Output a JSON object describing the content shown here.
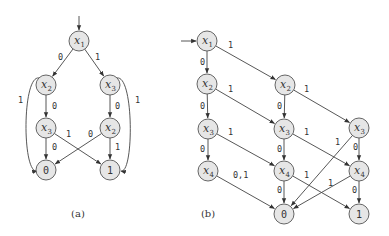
{
  "diagrams": [
    {
      "id": "a",
      "caption": "(a)",
      "caption_pos": [
        78,
        217
      ],
      "entry": {
        "from": [
          79,
          16
        ],
        "to": "n1",
        "dir": "down"
      },
      "nodes": [
        {
          "id": "n1",
          "var": "x",
          "sub": "1",
          "x": 79,
          "y": 41
        },
        {
          "id": "n2",
          "var": "x",
          "sub": "2",
          "x": 46,
          "y": 85
        },
        {
          "id": "n3",
          "var": "x",
          "sub": "3",
          "x": 110,
          "y": 85
        },
        {
          "id": "n4",
          "var": "x",
          "sub": "3",
          "x": 46,
          "y": 128
        },
        {
          "id": "n5",
          "var": "x",
          "sub": "2",
          "x": 110,
          "y": 128
        },
        {
          "id": "t0",
          "terminal": "0",
          "x": 46,
          "y": 170
        },
        {
          "id": "t1",
          "terminal": "1",
          "x": 110,
          "y": 170
        }
      ],
      "edges": [
        {
          "from": "n1",
          "to": "n2",
          "label": "0",
          "lx": 58,
          "ly": 60
        },
        {
          "from": "n1",
          "to": "n3",
          "label": "1",
          "lx": 95,
          "ly": 60
        },
        {
          "from": "n2",
          "to": "n4",
          "label": "0",
          "lx": 52,
          "ly": 109
        },
        {
          "from": "n2",
          "to": "t0",
          "label": "1",
          "lx": 18,
          "ly": 103,
          "curve": "left"
        },
        {
          "from": "n3",
          "to": "n5",
          "label": "0",
          "lx": 115,
          "ly": 109
        },
        {
          "from": "n3",
          "to": "t1",
          "label": "1",
          "lx": 135,
          "ly": 103,
          "curve": "right"
        },
        {
          "from": "n4",
          "to": "t0",
          "label": "0",
          "lx": 52,
          "ly": 150
        },
        {
          "from": "n4",
          "to": "t1",
          "label": "1",
          "lx": 66,
          "ly": 137
        },
        {
          "from": "n5",
          "to": "t0",
          "label": "0",
          "lx": 88,
          "ly": 137
        },
        {
          "from": "n5",
          "to": "t1",
          "label": "1",
          "lx": 115,
          "ly": 150
        }
      ]
    },
    {
      "id": "b",
      "caption": "(b)",
      "caption_pos": [
        208,
        217
      ],
      "entry": {
        "from": [
          181,
          41
        ],
        "to": "m1",
        "dir": "right"
      },
      "nodes": [
        {
          "id": "m1",
          "var": "x",
          "sub": "1",
          "x": 207,
          "y": 41
        },
        {
          "id": "m2",
          "var": "x",
          "sub": "2",
          "x": 207,
          "y": 84
        },
        {
          "id": "m3",
          "var": "x",
          "sub": "2",
          "x": 285,
          "y": 85
        },
        {
          "id": "m4",
          "var": "x",
          "sub": "3",
          "x": 208,
          "y": 129
        },
        {
          "id": "m5",
          "var": "x",
          "sub": "3",
          "x": 284,
          "y": 129
        },
        {
          "id": "m6",
          "var": "x",
          "sub": "3",
          "x": 359,
          "y": 128
        },
        {
          "id": "m7",
          "var": "x",
          "sub": "4",
          "x": 208,
          "y": 171
        },
        {
          "id": "m8",
          "var": "x",
          "sub": "4",
          "x": 284,
          "y": 171
        },
        {
          "id": "m9",
          "var": "x",
          "sub": "4",
          "x": 359,
          "y": 171
        },
        {
          "id": "u0",
          "terminal": "0",
          "x": 284,
          "y": 214
        },
        {
          "id": "u1",
          "terminal": "1",
          "x": 359,
          "y": 214
        }
      ],
      "edges": [
        {
          "from": "m1",
          "to": "m2",
          "label": "0",
          "lx": 200,
          "ly": 65
        },
        {
          "from": "m1",
          "to": "m3",
          "label": "1",
          "lx": 228,
          "ly": 48
        },
        {
          "from": "m2",
          "to": "m4",
          "label": "0",
          "lx": 200,
          "ly": 109
        },
        {
          "from": "m2",
          "to": "m5",
          "label": "1",
          "lx": 228,
          "ly": 92
        },
        {
          "from": "m3",
          "to": "m5",
          "label": "0",
          "lx": 277,
          "ly": 109
        },
        {
          "from": "m3",
          "to": "m6",
          "label": "1",
          "lx": 304,
          "ly": 92
        },
        {
          "from": "m4",
          "to": "m7",
          "label": "0",
          "lx": 200,
          "ly": 152
        },
        {
          "from": "m4",
          "to": "m8",
          "label": "1",
          "lx": 228,
          "ly": 135
        },
        {
          "from": "m5",
          "to": "m8",
          "label": "0",
          "lx": 277,
          "ly": 152
        },
        {
          "from": "m5",
          "to": "m9",
          "label": "1",
          "lx": 304,
          "ly": 135
        },
        {
          "from": "m6",
          "to": "u0",
          "label": "1",
          "lx": 335,
          "ly": 145
        },
        {
          "from": "m6",
          "to": "m9",
          "label": "0",
          "lx": 353,
          "ly": 150
        },
        {
          "from": "m7",
          "to": "u0",
          "label": "0,1",
          "lx": 233,
          "ly": 178
        },
        {
          "from": "m8",
          "to": "u0",
          "label": "0",
          "lx": 277,
          "ly": 193
        },
        {
          "from": "m8",
          "to": "u1",
          "label": "1",
          "lx": 304,
          "ly": 178
        },
        {
          "from": "m9",
          "to": "u0",
          "label": "1",
          "lx": 328,
          "ly": 186
        },
        {
          "from": "m9",
          "to": "u1",
          "label": "0",
          "lx": 352,
          "ly": 193
        }
      ]
    }
  ],
  "style": {
    "node_radius": 10,
    "node_fill": "#e6e6e6",
    "stroke": "#444444"
  }
}
